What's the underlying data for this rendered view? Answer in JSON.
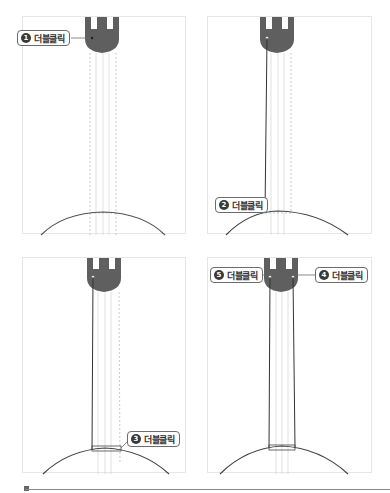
{
  "figure": {
    "panels": [
      {
        "id": 1,
        "callouts": [
          {
            "number": "1",
            "label": "더블클릭",
            "side": "left"
          }
        ]
      },
      {
        "id": 2,
        "callouts": [
          {
            "number": "2",
            "label": "더블클릭",
            "side": "left"
          }
        ]
      },
      {
        "id": 3,
        "callouts": [
          {
            "number": "3",
            "label": "더블클릭",
            "side": "right"
          }
        ]
      },
      {
        "id": 4,
        "callouts": [
          {
            "number": "5",
            "label": "더블클릭",
            "side": "left"
          },
          {
            "number": "4",
            "label": "더블클릭",
            "side": "right"
          }
        ]
      }
    ],
    "colors": {
      "headstock": "#5f5f5f",
      "outline": "#444444",
      "guide": "#bdbdbd",
      "panel_border": "#e6e6e6",
      "callout_border": "#6b6b6b"
    }
  }
}
